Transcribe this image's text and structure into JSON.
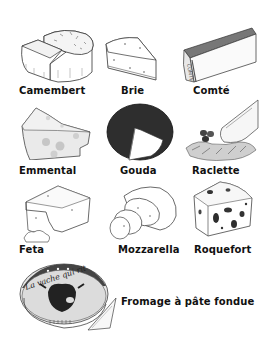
{
  "cheeses": [
    {
      "name": "Camembert"
    },
    {
      "name": "Brie"
    },
    {
      "name": "Comté"
    },
    {
      "name": "Emmental"
    },
    {
      "name": "Gouda"
    },
    {
      "name": "Raclette"
    },
    {
      "name": "Feta"
    },
    {
      "name": "Mozzarella"
    },
    {
      "name": "Roquefort"
    },
    {
      "name": "Fromage à pâte fondue"
    }
  ],
  "box_text": "La vache qui rit"
}
